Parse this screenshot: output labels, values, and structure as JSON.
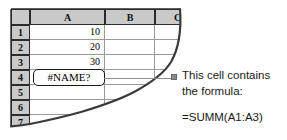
{
  "spreadsheet": {
    "corner_label": "",
    "column_headers": [
      "A",
      "B",
      "C"
    ],
    "row_headers": [
      "1",
      "2",
      "3",
      "4",
      "5",
      "6",
      "7"
    ],
    "cells": {
      "a1": "10",
      "a2": "20",
      "a3": "30",
      "a4": "#NAME?",
      "a5": "",
      "a6": "",
      "a7": "",
      "b1": "",
      "b2": "",
      "b3": "",
      "b4": "",
      "b5": "",
      "b6": "",
      "b7": "",
      "c1": "",
      "c2": "",
      "c3": "",
      "c4": "",
      "c5": "",
      "c6": "",
      "c7": ""
    },
    "error_cell_reference": "A4",
    "error_cell_value": "#NAME?"
  },
  "annotation": {
    "line1": "This cell contains",
    "line2": "the formula:",
    "formula": "=SUMM(A1:A3)",
    "bullet_icon": "square-bullet-icon"
  },
  "colors": {
    "header_fill": "#c9c9c9",
    "grid_line": "#9a9a9a",
    "header_border": "#2b2b2b",
    "text": "#1a1a1a",
    "bullet": "#8a8a8a",
    "torn_edge": "#3a3a3a",
    "sheet_background": "#ffffff"
  }
}
